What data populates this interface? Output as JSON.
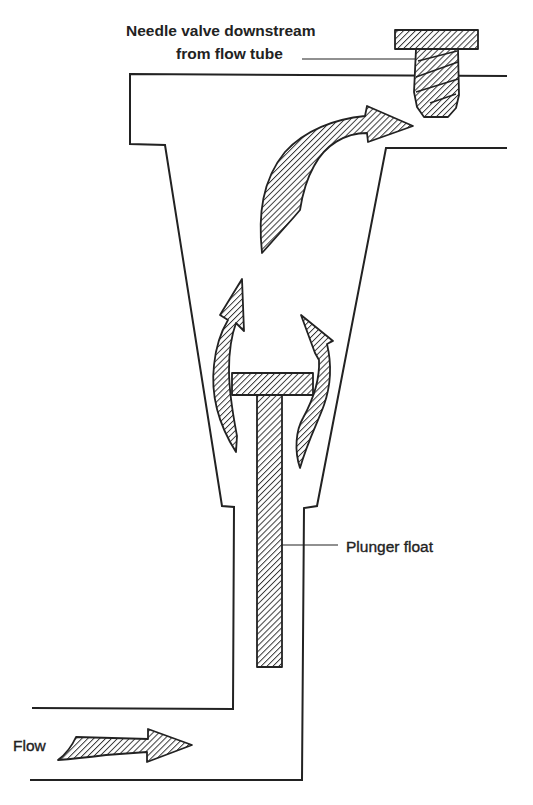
{
  "diagram": {
    "labels": {
      "needle_valve_line1": "Needle valve downstream",
      "needle_valve_line2": "from flow tube",
      "plunger_float": "Plunger float",
      "flow": "Flow"
    },
    "components": [
      {
        "id": "flow-tube",
        "description": "Tapered (conical) flow tube body"
      },
      {
        "id": "needle-valve",
        "description": "Threaded needle valve at outlet, downstream of flow tube"
      },
      {
        "id": "plunger-float",
        "description": "T-shaped plunger float inside inlet bore"
      },
      {
        "id": "inlet-pipe",
        "description": "Horizontal inlet pipe at bottom"
      }
    ],
    "arrows": [
      {
        "id": "inlet-flow-arrow",
        "direction": "right"
      },
      {
        "id": "bypass-flow-arrow-left",
        "direction": "up"
      },
      {
        "id": "bypass-flow-arrow-right",
        "direction": "up"
      },
      {
        "id": "outlet-flow-arrow",
        "direction": "up-right toward needle valve"
      }
    ],
    "colors": {
      "line": "#222222",
      "background": "#ffffff"
    }
  }
}
